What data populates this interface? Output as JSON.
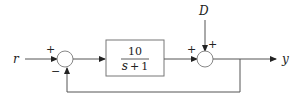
{
  "diagram": {
    "type": "feedback-block-diagram",
    "signals": {
      "input": "r",
      "disturbance": "D",
      "output": "y"
    },
    "block": {
      "numerator": "10",
      "denominator_var": "s",
      "denominator_op": "+",
      "denominator_const": "1"
    },
    "summing_junction_1": {
      "input_sign": "+",
      "feedback_sign": "−"
    },
    "summing_junction_2": {
      "input_sign": "+",
      "disturbance_sign": "+"
    }
  }
}
